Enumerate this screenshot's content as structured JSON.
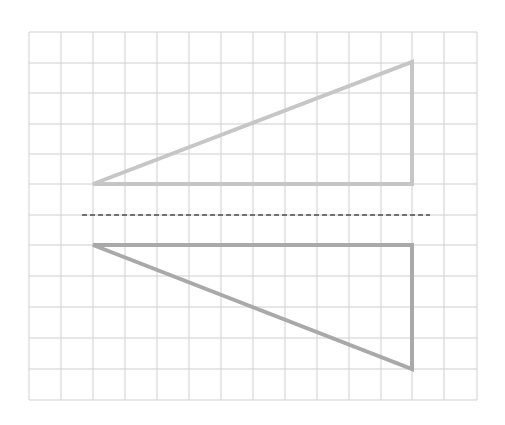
{
  "diagram": {
    "colors": {
      "background": "#ffffff",
      "grid": "#cfcfcf",
      "original_triangle": "#c6c6c6",
      "reflected_triangle": "#a9a9a9",
      "mirror_line": "#707070"
    },
    "grid": {
      "x_lines": [
        29,
        61,
        93,
        125,
        157,
        189,
        221,
        253,
        285,
        317,
        349,
        381,
        412,
        444,
        477
      ],
      "y_lines": [
        32,
        63,
        93,
        124,
        154,
        184,
        215,
        245,
        276,
        307,
        338,
        369,
        400
      ]
    },
    "original_triangle": {
      "points": [
        [
          93,
          184
        ],
        [
          412,
          62
        ],
        [
          412,
          184
        ]
      ]
    },
    "reflected_triangle": {
      "points": [
        [
          93,
          245
        ],
        [
          412,
          245
        ],
        [
          412,
          369
        ]
      ]
    },
    "mirror_line": {
      "x1": 82,
      "y1": 215,
      "x2": 430,
      "y2": 215
    }
  }
}
